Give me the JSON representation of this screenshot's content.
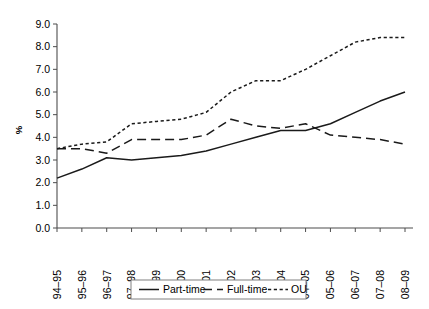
{
  "chart_data": {
    "type": "line",
    "title": "",
    "xlabel": "",
    "ylabel": "%",
    "ylim": [
      0.0,
      9.0
    ],
    "ytick_step": 1.0,
    "grid": false,
    "legend_position": "bottom",
    "categories": [
      "94–95",
      "95–96",
      "96–97",
      "97–98",
      "98–99",
      "99–00",
      "00–01",
      "01–02",
      "02–03",
      "03–04",
      "04–05",
      "05–06",
      "06–07",
      "07–08",
      "08–09"
    ],
    "ytick_labels": [
      "0.0",
      "1.0",
      "2.0",
      "3.0",
      "4.0",
      "5.0",
      "6.0",
      "7.0",
      "8.0",
      "9.0"
    ],
    "series": [
      {
        "name": "Part-time",
        "style": "solid",
        "color": "#1a1a1a",
        "values": [
          2.2,
          2.6,
          3.1,
          3.0,
          3.1,
          3.2,
          3.4,
          3.7,
          4.0,
          4.3,
          4.3,
          4.6,
          5.1,
          5.6,
          6.0
        ]
      },
      {
        "name": "Full-time",
        "style": "dashed",
        "color": "#1a1a1a",
        "values": [
          3.5,
          3.5,
          3.3,
          3.9,
          3.9,
          3.9,
          4.1,
          4.8,
          4.5,
          4.4,
          4.6,
          4.1,
          4.0,
          3.9,
          3.7
        ]
      },
      {
        "name": "OU",
        "style": "dotted",
        "color": "#1a1a1a",
        "values": [
          3.5,
          3.7,
          3.8,
          4.6,
          4.7,
          4.8,
          5.1,
          6.0,
          6.5,
          6.5,
          7.0,
          7.6,
          8.2,
          8.4,
          8.4
        ]
      }
    ]
  },
  "legend": {
    "entries": [
      {
        "label": "Part-time",
        "style": "solid"
      },
      {
        "label": "Full-time",
        "style": "dashed"
      },
      {
        "label": "OU",
        "style": "dotted"
      }
    ]
  }
}
